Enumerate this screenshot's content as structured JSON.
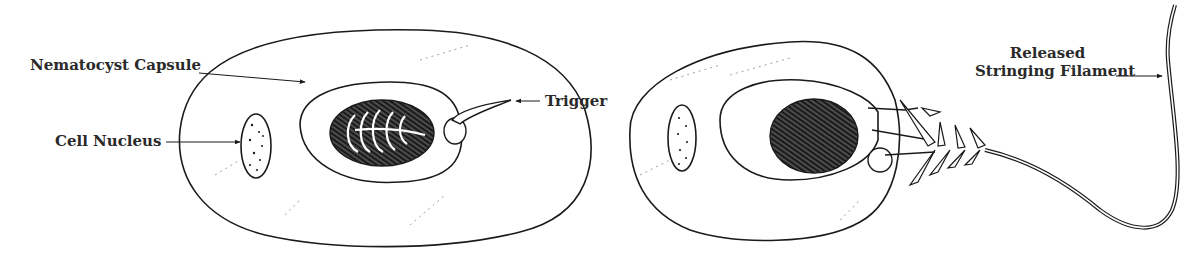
{
  "figure": {
    "panels": [
      {
        "id": "undischarged",
        "labels": {
          "capsule": "Nematocyst Capsule",
          "nucleus": "Cell Nucleus",
          "trigger": "Trigger"
        }
      },
      {
        "id": "discharged",
        "labels": {
          "filament_line1": "Released",
          "filament_line2": "Stringing Filament"
        }
      }
    ],
    "colors": {
      "ink": "#1a1a1a",
      "text": "#2a2a2a",
      "background": "#ffffff"
    }
  }
}
